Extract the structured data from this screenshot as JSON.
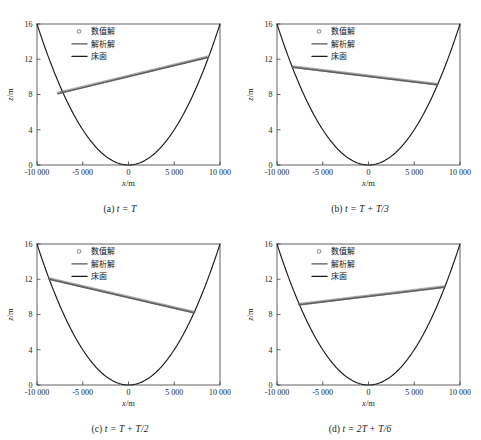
{
  "figure": {
    "panels": [
      {
        "id": "a",
        "caption_prefix": "(a)",
        "caption_expr": "t = T",
        "legend": [
          {
            "label": "数值解",
            "marker": "circle",
            "color": "#555555"
          },
          {
            "label": "解析解",
            "marker": "line",
            "color": "#555555"
          },
          {
            "label": "床面",
            "marker": "line",
            "color": "#1a1a1a"
          }
        ],
        "chart_data": {
          "type": "line",
          "title": "",
          "xlabel": "x/m",
          "ylabel": "z/m",
          "xlim": [
            -10000,
            10000
          ],
          "ylim": [
            0,
            16
          ],
          "xticks": [
            -10000,
            -5000,
            0,
            5000,
            10000
          ],
          "xticklabels": [
            "-10 000",
            "-5 000",
            "0",
            "5 000",
            "10 000"
          ],
          "yticks": [
            0,
            4,
            8,
            12,
            16
          ],
          "yticklabels": [
            "0",
            "4",
            "8",
            "12",
            "16"
          ],
          "grid": false,
          "legend_position": "upper-center-left",
          "series": [
            {
              "name": "床面",
              "type": "bed-parabola",
              "style": "solid",
              "color": "#1a1a1a",
              "vertex_x": 0,
              "vertex_z": 0,
              "z_at_x": 16,
              "x_at_zmax": 10000
            },
            {
              "name": "解析解",
              "type": "water-surface-line",
              "style": "solid",
              "color": "#555555",
              "x_left": -7700,
              "z_left": 8.1,
              "x_right": 8650,
              "z_right": 12.2
            },
            {
              "name": "数值解",
              "type": "water-surface-markers",
              "style": "open-circles",
              "color": "#666666",
              "x_left": -7700,
              "z_left": 8.1,
              "x_right": 8650,
              "z_right": 12.2,
              "marker_count": 86
            }
          ]
        }
      },
      {
        "id": "b",
        "caption_prefix": "(b)",
        "caption_expr": "t = T + T/3",
        "legend": [
          {
            "label": "数值解",
            "marker": "circle",
            "color": "#555555"
          },
          {
            "label": "解析解",
            "marker": "line",
            "color": "#555555"
          },
          {
            "label": "床面",
            "marker": "line",
            "color": "#1a1a1a"
          }
        ],
        "chart_data": {
          "type": "line",
          "title": "",
          "xlabel": "x/m",
          "ylabel": "z/m",
          "xlim": [
            -10000,
            10000
          ],
          "ylim": [
            0,
            16
          ],
          "xticks": [
            -10000,
            -5000,
            0,
            5000,
            10000
          ],
          "xticklabels": [
            "-10 000",
            "-5 000",
            "0",
            "5 000",
            "10 000"
          ],
          "yticks": [
            0,
            4,
            8,
            12,
            16
          ],
          "yticklabels": [
            "0",
            "4",
            "8",
            "12",
            "16"
          ],
          "grid": false,
          "legend_position": "upper-center-left",
          "series": [
            {
              "name": "床面",
              "type": "bed-parabola",
              "style": "solid",
              "color": "#1a1a1a",
              "vertex_x": 0,
              "vertex_z": 0,
              "z_at_x": 16,
              "x_at_zmax": 10000
            },
            {
              "name": "解析解",
              "type": "water-surface-line",
              "style": "solid",
              "color": "#555555",
              "x_left": -8300,
              "z_left": 11.1,
              "x_right": 7500,
              "z_right": 9.1
            },
            {
              "name": "数值解",
              "type": "water-surface-markers",
              "style": "open-circles",
              "color": "#666666",
              "x_left": -8300,
              "z_left": 11.1,
              "x_right": 7500,
              "z_right": 9.1,
              "marker_count": 86
            }
          ]
        }
      },
      {
        "id": "c",
        "caption_prefix": "(c)",
        "caption_expr": "t = T + T/2",
        "legend": [
          {
            "label": "数值解",
            "marker": "circle",
            "color": "#555555"
          },
          {
            "label": "解析解",
            "marker": "line",
            "color": "#555555"
          },
          {
            "label": "床面",
            "marker": "line",
            "color": "#1a1a1a"
          }
        ],
        "chart_data": {
          "type": "line",
          "title": "",
          "xlabel": "x/m",
          "ylabel": "z/m",
          "xlim": [
            -10000,
            10000
          ],
          "ylim": [
            0,
            16
          ],
          "xticks": [
            -10000,
            -5000,
            0,
            5000,
            10000
          ],
          "xticklabels": [
            "-10 000",
            "-5 000",
            "0",
            "5 000",
            "10 000"
          ],
          "yticks": [
            0,
            4,
            8,
            12,
            16
          ],
          "yticklabels": [
            "0",
            "4",
            "8",
            "12",
            "16"
          ],
          "grid": false,
          "legend_position": "upper-center-left",
          "series": [
            {
              "name": "床面",
              "type": "bed-parabola",
              "style": "solid",
              "color": "#1a1a1a",
              "vertex_x": 0,
              "vertex_z": 0,
              "z_at_x": 16,
              "x_at_zmax": 10000
            },
            {
              "name": "解析解",
              "type": "water-surface-line",
              "style": "solid",
              "color": "#555555",
              "x_left": -8650,
              "z_left": 12.0,
              "x_right": 7150,
              "z_right": 8.2
            },
            {
              "name": "数值解",
              "type": "water-surface-markers",
              "style": "open-circles",
              "color": "#666666",
              "x_left": -8650,
              "z_left": 12.0,
              "x_right": 7150,
              "z_right": 8.2,
              "marker_count": 86
            }
          ]
        }
      },
      {
        "id": "d",
        "caption_prefix": "(d)",
        "caption_expr": "t = 2T + T/6",
        "legend": [
          {
            "label": "数值解",
            "marker": "circle",
            "color": "#555555"
          },
          {
            "label": "解析解",
            "marker": "line",
            "color": "#555555"
          },
          {
            "label": "床面",
            "marker": "line",
            "color": "#1a1a1a"
          }
        ],
        "chart_data": {
          "type": "line",
          "title": "",
          "xlabel": "x/m",
          "ylabel": "z/m",
          "xlim": [
            -10000,
            10000
          ],
          "ylim": [
            0,
            16
          ],
          "xticks": [
            -10000,
            -5000,
            0,
            5000,
            10000
          ],
          "xticklabels": [
            "-10 000",
            "-5 000",
            "0",
            "5 000",
            "10 000"
          ],
          "yticks": [
            0,
            4,
            8,
            12,
            16
          ],
          "yticklabels": [
            "0",
            "4",
            "8",
            "12",
            "16"
          ],
          "grid": false,
          "legend_position": "upper-center-left",
          "series": [
            {
              "name": "床面",
              "type": "bed-parabola",
              "style": "solid",
              "color": "#1a1a1a",
              "vertex_x": 0,
              "vertex_z": 0,
              "z_at_x": 16,
              "x_at_zmax": 10000
            },
            {
              "name": "解析解",
              "type": "water-surface-line",
              "style": "solid",
              "color": "#555555",
              "x_left": -7550,
              "z_left": 9.1,
              "x_right": 8300,
              "z_right": 11.1
            },
            {
              "name": "数值解",
              "type": "water-surface-markers",
              "style": "open-circles",
              "color": "#666666",
              "x_left": -7550,
              "z_left": 9.1,
              "x_right": 8300,
              "z_right": 11.1,
              "marker_count": 86
            }
          ]
        }
      }
    ]
  }
}
